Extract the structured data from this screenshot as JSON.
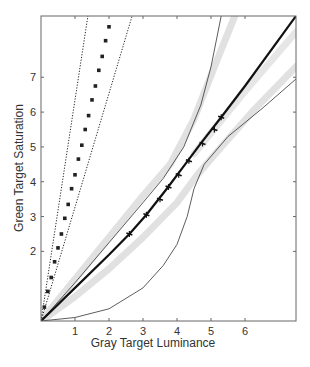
{
  "chart_data": {
    "type": "line",
    "title": "",
    "xlabel": "Gray Target Luminance",
    "ylabel": "Green Target Saturation",
    "xlim": [
      0,
      7.5
    ],
    "ylim": [
      0,
      8.76
    ],
    "xticks": [
      1,
      2,
      3,
      4,
      5,
      6
    ],
    "yticks": [
      2,
      3,
      4,
      5,
      6,
      7
    ],
    "grid": false,
    "legend": null,
    "series": [
      {
        "name": "steep-data-squares",
        "style": "square-markers",
        "color": "#222222",
        "points": [
          [
            0.1,
            0.4
          ],
          [
            0.2,
            0.85
          ],
          [
            0.3,
            1.25
          ],
          [
            0.4,
            1.7
          ],
          [
            0.5,
            2.1
          ],
          [
            0.6,
            2.5
          ],
          [
            0.7,
            2.95
          ],
          [
            0.8,
            3.35
          ],
          [
            0.9,
            3.8
          ],
          [
            1.0,
            4.2
          ],
          [
            1.1,
            4.65
          ],
          [
            1.2,
            5.05
          ],
          [
            1.3,
            5.5
          ],
          [
            1.4,
            5.9
          ],
          [
            1.5,
            6.35
          ],
          [
            1.6,
            6.75
          ],
          [
            1.7,
            7.2
          ],
          [
            1.8,
            7.6
          ],
          [
            1.9,
            8.05
          ],
          [
            2.0,
            8.45
          ]
        ]
      },
      {
        "name": "steep-bound-left",
        "style": "dotted",
        "color": "#222222",
        "points": [
          [
            0,
            0
          ],
          [
            1.38,
            8.76
          ]
        ]
      },
      {
        "name": "steep-bound-right",
        "style": "dotted",
        "color": "#222222",
        "points": [
          [
            0,
            0
          ],
          [
            2.68,
            8.76
          ]
        ]
      },
      {
        "name": "main-fit",
        "style": "thick-solid",
        "color": "#111111",
        "points": [
          [
            0,
            0
          ],
          [
            1,
            0.95
          ],
          [
            2,
            1.9
          ],
          [
            2.6,
            2.5
          ],
          [
            3.1,
            3.05
          ],
          [
            3.7,
            3.8
          ],
          [
            4.2,
            4.45
          ],
          [
            4.7,
            5.1
          ],
          [
            5.3,
            5.85
          ],
          [
            6,
            6.75
          ],
          [
            7.5,
            8.76
          ]
        ]
      },
      {
        "name": "main-data-ticks",
        "style": "tick-markers",
        "color": "#111111",
        "points": [
          [
            2.6,
            2.5
          ],
          [
            3.1,
            3.05
          ],
          [
            3.5,
            3.5
          ],
          [
            3.75,
            3.85
          ],
          [
            4.05,
            4.2
          ],
          [
            4.35,
            4.6
          ],
          [
            4.75,
            5.1
          ],
          [
            5.1,
            5.5
          ],
          [
            5.3,
            5.85
          ]
        ]
      },
      {
        "name": "upper-thin-curve",
        "style": "thin-solid",
        "color": "#333333",
        "points": [
          [
            0,
            0
          ],
          [
            1,
            1.1
          ],
          [
            2,
            2.25
          ],
          [
            3,
            3.4
          ],
          [
            3.6,
            4.1
          ],
          [
            4.2,
            5.0
          ],
          [
            4.7,
            6.2
          ],
          [
            5.0,
            7.3
          ],
          [
            5.3,
            8.76
          ]
        ]
      },
      {
        "name": "lower-thin-curve",
        "style": "thin-solid",
        "color": "#333333",
        "points": [
          [
            0,
            0
          ],
          [
            1,
            0.1
          ],
          [
            2,
            0.35
          ],
          [
            3,
            0.95
          ],
          [
            3.6,
            1.6
          ],
          [
            4.0,
            2.2
          ],
          [
            4.3,
            3.0
          ],
          [
            4.5,
            3.8
          ],
          [
            4.8,
            4.5
          ],
          [
            5.5,
            5.3
          ],
          [
            6.5,
            6.1
          ],
          [
            7.5,
            6.95
          ]
        ]
      },
      {
        "name": "gray-band-upper",
        "style": "wide-gray",
        "color": "#dcdcdc",
        "points": [
          [
            0,
            0
          ],
          [
            1,
            1.2
          ],
          [
            2,
            2.4
          ],
          [
            3,
            3.6
          ],
          [
            3.8,
            4.5
          ],
          [
            4.5,
            5.8
          ],
          [
            5.1,
            7.3
          ],
          [
            5.7,
            8.76
          ]
        ]
      },
      {
        "name": "gray-band-lower",
        "style": "wide-gray",
        "color": "#dcdcdc",
        "points": [
          [
            0,
            0
          ],
          [
            1,
            0.7
          ],
          [
            2,
            1.5
          ],
          [
            3,
            2.4
          ],
          [
            4,
            3.4
          ],
          [
            4.6,
            4.2
          ],
          [
            5.3,
            5.0
          ],
          [
            6.3,
            6.1
          ],
          [
            7.5,
            7.3
          ]
        ]
      },
      {
        "name": "gray-band-main-right",
        "style": "wide-gray",
        "color": "#e2e2e2",
        "points": [
          [
            4.5,
            4.8
          ],
          [
            6,
            6.6
          ],
          [
            7.5,
            8.3
          ]
        ]
      }
    ]
  }
}
